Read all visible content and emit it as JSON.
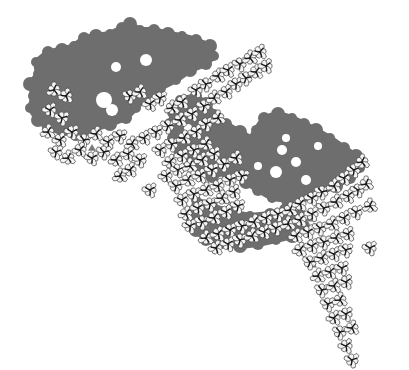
{
  "canvas": {
    "width": 409,
    "height": 370,
    "background": "#ffffff"
  },
  "colors": {
    "shadow": "#6e6e6e",
    "unit_fill": "#f4f4f4",
    "unit_stroke": "#4a4a4a",
    "unit_core": "#1a1a1a",
    "pocket": "#7a7a7a"
  },
  "shadow_regions": [
    {
      "name": "upper-left-shadow",
      "points": [
        [
          36,
          62
        ],
        [
          48,
          52
        ],
        [
          62,
          50
        ],
        [
          74,
          46
        ],
        [
          84,
          38
        ],
        [
          96,
          36
        ],
        [
          110,
          34
        ],
        [
          122,
          28
        ],
        [
          130,
          24
        ],
        [
          140,
          30
        ],
        [
          154,
          30
        ],
        [
          168,
          34
        ],
        [
          182,
          36
        ],
        [
          196,
          40
        ],
        [
          210,
          46
        ],
        [
          214,
          56
        ],
        [
          206,
          64
        ],
        [
          190,
          70
        ],
        [
          176,
          80
        ],
        [
          160,
          88
        ],
        [
          146,
          96
        ],
        [
          136,
          108
        ],
        [
          126,
          118
        ],
        [
          110,
          124
        ],
        [
          96,
          128
        ],
        [
          86,
          130
        ],
        [
          76,
          134
        ],
        [
          62,
          132
        ],
        [
          48,
          128
        ],
        [
          38,
          120
        ],
        [
          30,
          108
        ],
        [
          34,
          96
        ],
        [
          30,
          84
        ],
        [
          38,
          74
        ]
      ]
    },
    {
      "name": "middle-shadow",
      "points": [
        [
          180,
          100
        ],
        [
          196,
          96
        ],
        [
          206,
          104
        ],
        [
          214,
          114
        ],
        [
          226,
          124
        ],
        [
          240,
          132
        ],
        [
          254,
          140
        ],
        [
          262,
          148
        ],
        [
          250,
          156
        ],
        [
          240,
          166
        ],
        [
          226,
          172
        ],
        [
          212,
          176
        ],
        [
          200,
          172
        ],
        [
          190,
          162
        ],
        [
          180,
          150
        ],
        [
          172,
          138
        ],
        [
          170,
          124
        ],
        [
          174,
          112
        ]
      ]
    },
    {
      "name": "right-shadow",
      "points": [
        [
          256,
          130
        ],
        [
          264,
          118
        ],
        [
          278,
          114
        ],
        [
          292,
          118
        ],
        [
          304,
          124
        ],
        [
          316,
          130
        ],
        [
          330,
          138
        ],
        [
          344,
          148
        ],
        [
          356,
          156
        ],
        [
          360,
          168
        ],
        [
          350,
          178
        ],
        [
          336,
          186
        ],
        [
          320,
          192
        ],
        [
          304,
          196
        ],
        [
          288,
          200
        ],
        [
          272,
          198
        ],
        [
          258,
          190
        ],
        [
          246,
          182
        ],
        [
          236,
          174
        ],
        [
          232,
          162
        ],
        [
          240,
          150
        ],
        [
          250,
          140
        ]
      ]
    },
    {
      "name": "lower-shadow",
      "points": [
        [
          196,
          200
        ],
        [
          212,
          206
        ],
        [
          230,
          212
        ],
        [
          250,
          216
        ],
        [
          270,
          214
        ],
        [
          286,
          210
        ],
        [
          300,
          214
        ],
        [
          304,
          226
        ],
        [
          292,
          236
        ],
        [
          276,
          240
        ],
        [
          258,
          244
        ],
        [
          240,
          246
        ],
        [
          222,
          244
        ],
        [
          206,
          240
        ],
        [
          196,
          230
        ],
        [
          190,
          218
        ]
      ]
    }
  ],
  "shadow_holes": [
    {
      "cx": 116,
      "cy": 67,
      "r": 5
    },
    {
      "cx": 146,
      "cy": 60,
      "r": 6
    },
    {
      "cx": 104,
      "cy": 100,
      "r": 8
    },
    {
      "cx": 112,
      "cy": 110,
      "r": 6
    },
    {
      "cx": 188,
      "cy": 128,
      "r": 4
    },
    {
      "cx": 282,
      "cy": 150,
      "r": 5
    },
    {
      "cx": 296,
      "cy": 162,
      "r": 5
    },
    {
      "cx": 276,
      "cy": 172,
      "r": 6
    },
    {
      "cx": 306,
      "cy": 180,
      "r": 5
    },
    {
      "cx": 286,
      "cy": 138,
      "r": 4
    },
    {
      "cx": 318,
      "cy": 146,
      "r": 4
    },
    {
      "cx": 258,
      "cy": 166,
      "r": 4
    }
  ],
  "pockets": [
    {
      "cx": 162,
      "cy": 150,
      "r": 5
    },
    {
      "cx": 226,
      "cy": 200,
      "r": 5
    },
    {
      "cx": 206,
      "cy": 226,
      "r": 4
    },
    {
      "cx": 310,
      "cy": 218,
      "r": 5
    },
    {
      "cx": 312,
      "cy": 264,
      "r": 5
    },
    {
      "cx": 320,
      "cy": 288,
      "r": 4
    },
    {
      "cx": 92,
      "cy": 148,
      "r": 4
    }
  ],
  "units": [
    [
      54,
      90
    ],
    [
      66,
      96
    ],
    [
      50,
      110
    ],
    [
      62,
      118
    ],
    [
      48,
      132
    ],
    [
      60,
      140
    ],
    [
      72,
      132
    ],
    [
      84,
      140
    ],
    [
      96,
      134
    ],
    [
      108,
      142
    ],
    [
      120,
      136
    ],
    [
      132,
      144
    ],
    [
      144,
      138
    ],
    [
      156,
      132
    ],
    [
      168,
      126
    ],
    [
      180,
      120
    ],
    [
      192,
      114
    ],
    [
      204,
      106
    ],
    [
      214,
      98
    ],
    [
      226,
      92
    ],
    [
      236,
      84
    ],
    [
      246,
      78
    ],
    [
      256,
      72
    ],
    [
      266,
      66
    ],
    [
      56,
      152
    ],
    [
      68,
      158
    ],
    [
      80,
      150
    ],
    [
      92,
      158
    ],
    [
      104,
      152
    ],
    [
      116,
      160
    ],
    [
      128,
      154
    ],
    [
      140,
      160
    ],
    [
      120,
      176
    ],
    [
      130,
      170
    ],
    [
      150,
      190
    ],
    [
      130,
      96
    ],
    [
      140,
      92
    ],
    [
      150,
      104
    ],
    [
      160,
      98
    ],
    [
      172,
      108
    ],
    [
      182,
      102
    ],
    [
      196,
      90
    ],
    [
      206,
      84
    ],
    [
      218,
      76
    ],
    [
      228,
      70
    ],
    [
      240,
      64
    ],
    [
      250,
      58
    ],
    [
      260,
      52
    ],
    [
      160,
      150
    ],
    [
      172,
      144
    ],
    [
      184,
      138
    ],
    [
      196,
      132
    ],
    [
      206,
      124
    ],
    [
      218,
      118
    ],
    [
      170,
      162
    ],
    [
      182,
      156
    ],
    [
      194,
      150
    ],
    [
      206,
      144
    ],
    [
      166,
      176
    ],
    [
      178,
      170
    ],
    [
      190,
      166
    ],
    [
      202,
      160
    ],
    [
      214,
      154
    ],
    [
      176,
      186
    ],
    [
      188,
      180
    ],
    [
      200,
      176
    ],
    [
      212,
      170
    ],
    [
      224,
      164
    ],
    [
      236,
      158
    ],
    [
      182,
      200
    ],
    [
      194,
      194
    ],
    [
      206,
      190
    ],
    [
      218,
      186
    ],
    [
      230,
      180
    ],
    [
      242,
      176
    ],
    [
      186,
      214
    ],
    [
      198,
      208
    ],
    [
      210,
      204
    ],
    [
      222,
      198
    ],
    [
      234,
      192
    ],
    [
      190,
      226
    ],
    [
      202,
      222
    ],
    [
      214,
      218
    ],
    [
      226,
      212
    ],
    [
      238,
      206
    ],
    [
      206,
      238
    ],
    [
      218,
      234
    ],
    [
      230,
      230
    ],
    [
      242,
      226
    ],
    [
      254,
      222
    ],
    [
      266,
      218
    ],
    [
      278,
      214
    ],
    [
      290,
      210
    ],
    [
      300,
      204
    ],
    [
      312,
      198
    ],
    [
      322,
      192
    ],
    [
      334,
      186
    ],
    [
      344,
      178
    ],
    [
      354,
      170
    ],
    [
      362,
      162
    ],
    [
      216,
      248
    ],
    [
      228,
      244
    ],
    [
      240,
      240
    ],
    [
      252,
      236
    ],
    [
      264,
      232
    ],
    [
      276,
      228
    ],
    [
      288,
      224
    ],
    [
      300,
      220
    ],
    [
      312,
      214
    ],
    [
      324,
      208
    ],
    [
      336,
      202
    ],
    [
      348,
      196
    ],
    [
      358,
      190
    ],
    [
      366,
      184
    ],
    [
      296,
      236
    ],
    [
      308,
      232
    ],
    [
      320,
      228
    ],
    [
      332,
      224
    ],
    [
      344,
      218
    ],
    [
      356,
      212
    ],
    [
      370,
      206
    ],
    [
      300,
      250
    ],
    [
      312,
      246
    ],
    [
      324,
      242
    ],
    [
      336,
      238
    ],
    [
      348,
      234
    ],
    [
      370,
      248
    ],
    [
      310,
      262
    ],
    [
      322,
      258
    ],
    [
      334,
      254
    ],
    [
      346,
      250
    ],
    [
      318,
      276
    ],
    [
      330,
      272
    ],
    [
      342,
      268
    ],
    [
      322,
      290
    ],
    [
      334,
      286
    ],
    [
      346,
      282
    ],
    [
      328,
      304
    ],
    [
      340,
      300
    ],
    [
      334,
      318
    ],
    [
      346,
      314
    ],
    [
      340,
      332
    ],
    [
      352,
      328
    ],
    [
      346,
      346
    ],
    [
      352,
      360
    ]
  ],
  "unit_style": {
    "arm_length": 8,
    "arm_width": 4.2,
    "core_length": 5,
    "stroke_width": 0.7,
    "core_width": 1.3
  }
}
